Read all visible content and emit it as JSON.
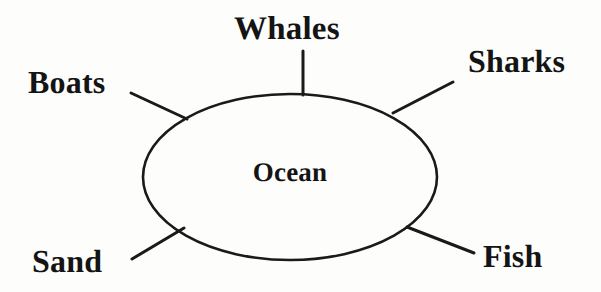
{
  "diagram": {
    "type": "word-web",
    "background_color": "#fdfdfc",
    "stroke_color": "#1a1a1a",
    "text_color": "#141414",
    "center": {
      "label": "Ocean",
      "shape": "ellipse",
      "cx": 290,
      "cy": 177,
      "rx": 147,
      "ry": 83
    },
    "nodes": [
      {
        "id": "whales",
        "label": "Whales",
        "position": "top",
        "connector": {
          "x1": 303,
          "y1": 51,
          "x2": 303,
          "y2": 95
        }
      },
      {
        "id": "sharks",
        "label": "Sharks",
        "position": "top-right",
        "connector": {
          "x1": 453,
          "y1": 82,
          "x2": 393,
          "y2": 113
        }
      },
      {
        "id": "boats",
        "label": "Boats",
        "position": "top-left",
        "connector": {
          "x1": 131,
          "y1": 93,
          "x2": 187,
          "y2": 119
        }
      },
      {
        "id": "sand",
        "label": "Sand",
        "position": "bottom-left",
        "connector": {
          "x1": 132,
          "y1": 259,
          "x2": 184,
          "y2": 228
        }
      },
      {
        "id": "fish",
        "label": "Fish",
        "position": "bottom-right",
        "connector": {
          "x1": 407,
          "y1": 227,
          "x2": 474,
          "y2": 253
        }
      }
    ]
  }
}
